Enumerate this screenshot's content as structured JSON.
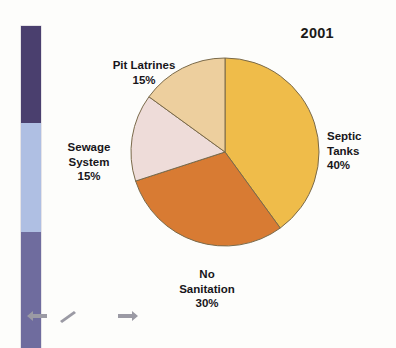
{
  "figure": {
    "title": "2001",
    "background_color": "#fdfdfb"
  },
  "color_bar": {
    "name": "vertical-color-band",
    "segments": [
      {
        "name": "dark-purple-segment",
        "color": "#4a3f6e"
      },
      {
        "name": "light-blue-segment",
        "color": "#afbfe3"
      },
      {
        "name": "slate-purple-segment",
        "color": "#6f6c9e"
      }
    ]
  },
  "icon_strip": {
    "icons": [
      {
        "name": "arrow-left-icon",
        "glyph": "arrow-left",
        "color": "#9b9aa4"
      },
      {
        "name": "pencil-icon",
        "glyph": "pencil",
        "color": "#9b9aa4"
      },
      {
        "name": "rectangle-icon",
        "glyph": "rectangle",
        "color": "#9b9aa4"
      },
      {
        "name": "arrow-right-icon",
        "glyph": "arrow-right",
        "color": "#9b9aa4"
      }
    ]
  },
  "labels": {
    "pit_latrines": {
      "name": "Pit Latrines",
      "percent": "15%"
    },
    "sewage_system": {
      "name": "Sewage\nSystem",
      "percent": "15%"
    },
    "septic_tanks": {
      "name": "Septic\nTanks",
      "percent": "40%"
    },
    "no_sanitation": {
      "name": "No\nSanitation",
      "percent": "30%"
    }
  },
  "chart_data": {
    "type": "pie",
    "title": "2001",
    "xlabel": "",
    "ylabel": "",
    "units": "percent",
    "start_angle_deg": 90,
    "direction": "clockwise",
    "total": 100,
    "labels": [
      "Septic Tanks",
      "No Sanitation",
      "Sewage System",
      "Pit Latrines"
    ],
    "values": [
      40,
      30,
      15,
      15
    ],
    "value_labels": [
      "40%",
      "30%",
      "15%",
      "15%"
    ],
    "colors": [
      "#efbc4a",
      "#d87b33",
      "#eedcd9",
      "#edcf9e"
    ],
    "slice_border_color": "#7a6a4a",
    "legend": "none",
    "legend_position": "outside-labels",
    "grid": false,
    "slices": [
      {
        "label": "Septic Tanks",
        "value": 40,
        "value_label": "40%",
        "color": "#efbc4a",
        "label_position": "right"
      },
      {
        "label": "No Sanitation",
        "value": 30,
        "value_label": "30%",
        "color": "#d87b33",
        "label_position": "bottom"
      },
      {
        "label": "Sewage System",
        "value": 15,
        "value_label": "15%",
        "color": "#eedcd9",
        "label_position": "left"
      },
      {
        "label": "Pit Latrines",
        "value": 15,
        "value_label": "15%",
        "color": "#edcf9e",
        "label_position": "top-left"
      }
    ]
  }
}
